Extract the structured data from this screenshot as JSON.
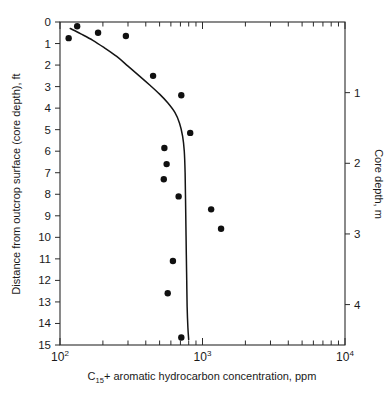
{
  "chart_data": {
    "type": "scatter",
    "title": "",
    "xlabel": "C15+ aromatic hydrocarbon concentration, ppm",
    "xlabel_parts": {
      "prefix": "C",
      "subscript": "15",
      "suffix": "+ aromatic hydrocarbon concentration, ppm"
    },
    "ylabel": "Distance from outcrop surface (core depth), ft",
    "ylabel_right": "Core depth, m",
    "xscale": "log",
    "xlim": [
      100,
      10000
    ],
    "ylim": [
      0,
      15
    ],
    "ylim_right": [
      0,
      4.572
    ],
    "grid": false,
    "legend": false,
    "x_tick_labels": [
      "10^2",
      "10^3",
      "10^4"
    ],
    "x_tick_values": [
      100,
      1000,
      10000
    ],
    "x_decade_exponents": [
      "2",
      "3",
      "4"
    ],
    "x_base": "10",
    "y_tick_labels": [
      "0",
      "1",
      "2",
      "3",
      "4",
      "5",
      "6",
      "7",
      "8",
      "9",
      "10",
      "11",
      "12",
      "13",
      "14",
      "15"
    ],
    "y_tick_values": [
      0,
      1,
      2,
      3,
      4,
      5,
      6,
      7,
      8,
      9,
      10,
      11,
      12,
      13,
      14,
      15
    ],
    "y_right_tick_labels": [
      "1",
      "2",
      "3",
      "4"
    ],
    "y_right_tick_values": [
      1,
      2,
      3,
      4
    ],
    "series": [
      {
        "name": "measured samples",
        "marker": "filled-circle",
        "color": "#101010",
        "points": [
          {
            "x": 132,
            "y": 0.2
          },
          {
            "x": 185,
            "y": 0.5
          },
          {
            "x": 115,
            "y": 0.75
          },
          {
            "x": 290,
            "y": 0.65
          },
          {
            "x": 450,
            "y": 2.5
          },
          {
            "x": 710,
            "y": 3.4
          },
          {
            "x": 820,
            "y": 5.15
          },
          {
            "x": 540,
            "y": 5.85
          },
          {
            "x": 560,
            "y": 6.6
          },
          {
            "x": 535,
            "y": 7.3
          },
          {
            "x": 680,
            "y": 8.1
          },
          {
            "x": 1150,
            "y": 8.7
          },
          {
            "x": 1350,
            "y": 9.6
          },
          {
            "x": 620,
            "y": 11.1
          },
          {
            "x": 570,
            "y": 12.6
          },
          {
            "x": 710,
            "y": 14.65
          }
        ]
      }
    ],
    "fitted_curve": {
      "name": "model fit profile",
      "color": "#141414",
      "points": [
        {
          "x": 118,
          "y": 0.3
        },
        {
          "x": 140,
          "y": 0.55
        },
        {
          "x": 170,
          "y": 0.85
        },
        {
          "x": 205,
          "y": 1.2
        },
        {
          "x": 250,
          "y": 1.6
        },
        {
          "x": 300,
          "y": 2.05
        },
        {
          "x": 360,
          "y": 2.5
        },
        {
          "x": 430,
          "y": 2.95
        },
        {
          "x": 500,
          "y": 3.35
        },
        {
          "x": 570,
          "y": 3.75
        },
        {
          "x": 640,
          "y": 4.2
        },
        {
          "x": 690,
          "y": 4.7
        },
        {
          "x": 725,
          "y": 5.3
        },
        {
          "x": 745,
          "y": 6.0
        },
        {
          "x": 755,
          "y": 7.0
        },
        {
          "x": 760,
          "y": 8.2
        },
        {
          "x": 765,
          "y": 9.5
        },
        {
          "x": 770,
          "y": 10.8
        },
        {
          "x": 775,
          "y": 12.0
        },
        {
          "x": 780,
          "y": 13.2
        },
        {
          "x": 790,
          "y": 14.2
        },
        {
          "x": 800,
          "y": 14.75
        }
      ]
    },
    "colors": {
      "axis": "#2b2b2b",
      "marker": "#101010",
      "curve": "#141414",
      "background": "#ffffff"
    }
  }
}
